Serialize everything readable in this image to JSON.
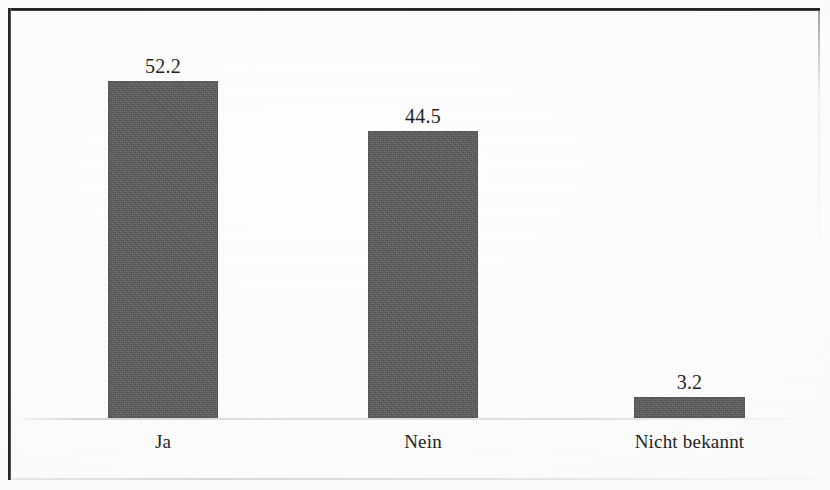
{
  "figure": {
    "background_color": "#ffffff",
    "frame_color": "#1d1d1d",
    "bar_color": "#5b5b5b",
    "axis_line_color": "#c8c8c8",
    "label_color": "#1f1f1f"
  },
  "chart_data": {
    "type": "bar",
    "title": "",
    "subtitle": "",
    "xlabel": "",
    "ylabel": "",
    "categories": [
      "Ja",
      "Nein",
      "Nicht bekannt"
    ],
    "values": [
      52.2,
      44.5,
      3.2
    ],
    "value_labels": [
      "52.2",
      "44.5",
      "3.2"
    ],
    "series": [
      {
        "name": "",
        "values": [
          52.2,
          44.5,
          3.2
        ]
      }
    ],
    "ylim": [
      0,
      62
    ],
    "grid": false,
    "legend": null,
    "legend_position": "none",
    "y_axis_visible": false,
    "y_tick_labels": [],
    "x_tick_labels": [
      "Ja",
      "Nein",
      "Nicht bekannt"
    ],
    "data_labels_shown": true,
    "annotations": []
  },
  "bars": [
    {
      "category": "Ja",
      "value": 52.2,
      "value_label": "52.2"
    },
    {
      "category": "Nein",
      "value": 44.5,
      "value_label": "44.5"
    },
    {
      "category": "Nicht bekannt",
      "value": 3.2,
      "value_label": "3.2"
    }
  ]
}
